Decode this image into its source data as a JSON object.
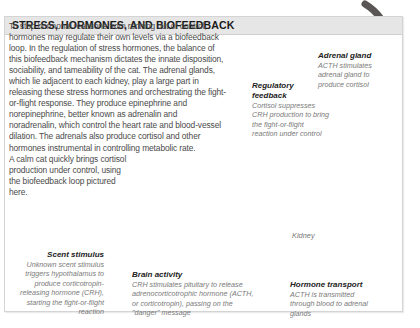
{
  "panel": {
    "title": "STRESS, HORMONES, AND BIOFEEDBACK",
    "body_paragraphs": [
      "To stop hormonal reactions from running out of control, hormones may regulate their own levels via a biofeedback loop. In the regulation of stress hormones, the balance of this biofeedback mechanism dictates the innate disposition, sociability, and tameability of the cat. The adrenal glands, which lie adjacent to each kidney, play a large part in releasing these stress hormones and orchestrating the fight-or-flight response. They produce epinephrine and norepinephrine, better known as adrenalin and noradrenalin, which control the heart rate and blood-vessel dilation. The adrenals also produce cortisol and other hormones instrumental in controlling metabolic rate.",
      "A calm cat quickly brings cortisol production under control, using the biofeedback loop pictured here."
    ]
  },
  "callouts": {
    "adrenal_gland": {
      "heading": "Adrenal gland",
      "text": "ACTH stimulates adrenal gland to produce cortisol"
    },
    "regulatory_feedback": {
      "heading": "Regulatory feedback",
      "text": "Cortisol suppresses CRH production to bring the fight-or-flight reaction under control"
    },
    "kidney": {
      "label": "Kidney"
    },
    "scent_stimulus": {
      "heading": "Scent stimulus",
      "text": "Unknown scent stimulus triggers hypothalamus to produce corticotropin-releasing hormone (CRH), starting the fight-or-flight reaction"
    },
    "brain_activity": {
      "heading": "Brain activity",
      "text": "CRH stimulates pituitary to release adrenocorticotrophic hormone (ACTH, or corticotropin), passing on the \"danger\" message"
    },
    "hormone_transport": {
      "heading": "Hormone transport",
      "text": "ACTH is transmitted through blood to adrenal glands"
    }
  },
  "colors": {
    "header_bg": "#e6e6e6",
    "panel_border": "#d4d4d4",
    "loop_line": "#1a1a1a",
    "cat_body": "#d9d3cc",
    "cat_points": "#4a4a4a"
  }
}
